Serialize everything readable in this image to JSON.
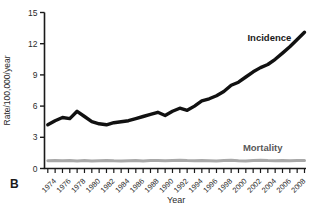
{
  "panel_label": "B",
  "colors": {
    "incidence_line": "#111111",
    "mortality_line": "#a8a8a8",
    "axis": "#1a1a1a",
    "text": "#2b2b2b",
    "mortality_label": "#595959",
    "background": "#ffffff"
  },
  "chart_data": {
    "type": "line",
    "title": "",
    "xlabel": "Year",
    "ylabel": "Rate/100,000/year",
    "xlim": [
      1973,
      2008
    ],
    "ylim": [
      0,
      15
    ],
    "grid": false,
    "yticks": [
      0,
      3,
      6,
      9,
      12,
      15
    ],
    "xtick_minor_every": 1,
    "xtick_label_every": 2,
    "xtick_labels": [
      "1974",
      "1976",
      "1978",
      "1980",
      "1982",
      "1984",
      "1986",
      "1988",
      "1990",
      "1992",
      "1994",
      "1996",
      "1998",
      "2000",
      "2002",
      "2004",
      "2006",
      "2008"
    ],
    "x": [
      1973,
      1974,
      1975,
      1976,
      1977,
      1978,
      1979,
      1980,
      1981,
      1982,
      1983,
      1984,
      1985,
      1986,
      1987,
      1988,
      1989,
      1990,
      1991,
      1992,
      1993,
      1994,
      1995,
      1996,
      1997,
      1998,
      1999,
      2000,
      2001,
      2002,
      2003,
      2004,
      2005,
      2006,
      2007,
      2008
    ],
    "series": [
      {
        "name": "Incidence",
        "color": "#111111",
        "stroke_width": 3.4,
        "values": [
          4.2,
          4.6,
          4.9,
          4.8,
          5.5,
          5.0,
          4.5,
          4.3,
          4.2,
          4.4,
          4.5,
          4.6,
          4.8,
          5.0,
          5.2,
          5.4,
          5.1,
          5.5,
          5.8,
          5.6,
          6.0,
          6.5,
          6.7,
          7.0,
          7.4,
          8.0,
          8.3,
          8.8,
          9.3,
          9.7,
          10.0,
          10.5,
          11.1,
          11.7,
          12.4,
          13.1
        ]
      },
      {
        "name": "Mortality",
        "color": "#a8a8a8",
        "stroke_width": 3.0,
        "values": [
          0.75,
          0.78,
          0.74,
          0.77,
          0.73,
          0.76,
          0.72,
          0.75,
          0.78,
          0.74,
          0.72,
          0.75,
          0.77,
          0.73,
          0.76,
          0.78,
          0.74,
          0.77,
          0.8,
          0.76,
          0.74,
          0.78,
          0.75,
          0.72,
          0.76,
          0.79,
          0.75,
          0.73,
          0.77,
          0.8,
          0.76,
          0.74,
          0.77,
          0.75,
          0.78,
          0.76
        ]
      }
    ],
    "annotations": [
      {
        "text": "Incidence",
        "x": 2006.2,
        "y": 12.55,
        "anchor": "end",
        "color": "#1a1a1a",
        "bold": true
      },
      {
        "text": "Mortality",
        "x": 2002.3,
        "y": 1.95,
        "anchor": "middle",
        "color": "#595959",
        "bold": true
      }
    ],
    "legend_position": "inline-annotations"
  }
}
